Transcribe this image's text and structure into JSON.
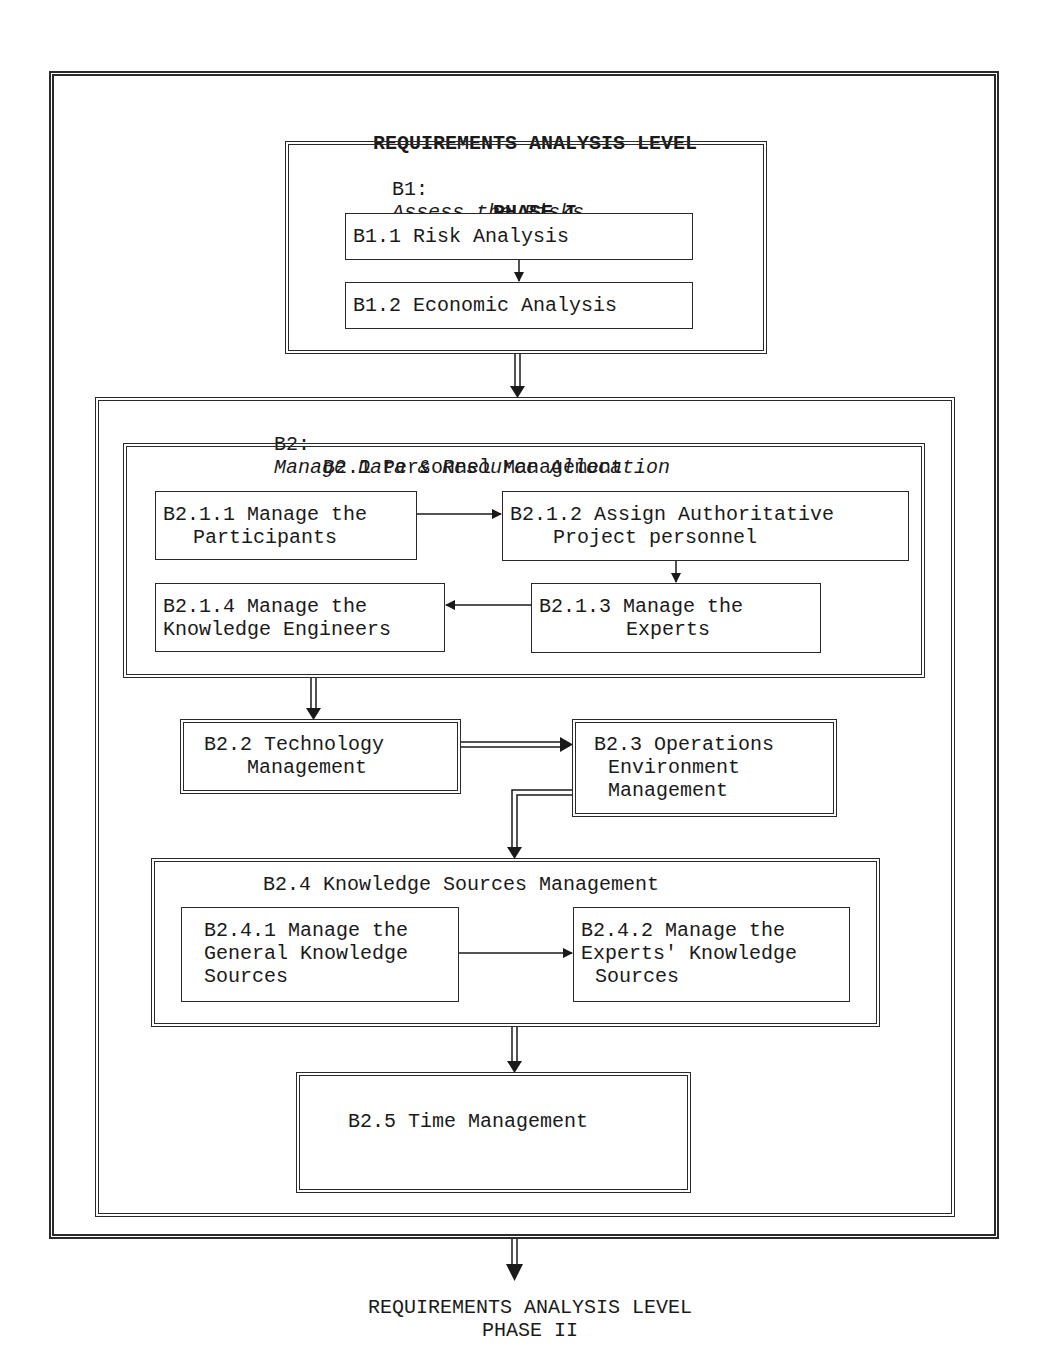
{
  "diagram": {
    "header": {
      "line1": "REQUIREMENTS ANALYSIS LEVEL",
      "line2": "PHASE I"
    },
    "b1": {
      "code": "B1:",
      "title": "Assess the Risks",
      "steps": [
        {
          "label": "B1.1 Risk Analysis"
        },
        {
          "label": "B1.2 Economic Analysis"
        }
      ]
    },
    "b2": {
      "code": "B2:",
      "title": "Manage Data & Resource Allocation",
      "b21": {
        "title": "B2.1 Personnel Management",
        "steps": [
          {
            "line1": "B2.1.1 Manage the",
            "line2": "Participants"
          },
          {
            "line1": "B2.1.2 Assign Authoritative",
            "line2": "Project personnel"
          },
          {
            "line1": "B2.1.3 Manage the",
            "line2": "Experts"
          },
          {
            "line1": "B2.1.4 Manage the",
            "line2": "Knowledge Engineers"
          }
        ]
      },
      "b22": {
        "line1": "B2.2 Technology",
        "line2": "Management"
      },
      "b23": {
        "line1": "B2.3 Operations",
        "line2": "Environment",
        "line3": "Management"
      },
      "b24": {
        "title": "B2.4 Knowledge Sources Management",
        "steps": [
          {
            "line1": "B2.4.1 Manage the",
            "line2": "General Knowledge",
            "line3": "Sources"
          },
          {
            "line1": "B2.4.2 Manage the",
            "line2": "Experts' Knowledge",
            "line3": "Sources"
          }
        ]
      },
      "b25": {
        "label": "B2.5 Time Management"
      }
    },
    "footer": {
      "line1": "REQUIREMENTS ANALYSIS LEVEL",
      "line2": "PHASE II"
    }
  }
}
